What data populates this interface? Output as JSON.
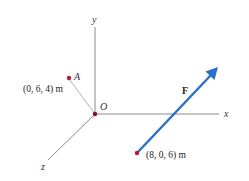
{
  "diagram": {
    "axes": {
      "x_label": "x",
      "y_label": "y",
      "z_label": "z",
      "origin_label": "O",
      "axis_color": "#8a8a8a"
    },
    "point_a": {
      "name": "A",
      "coords_label": "(0, 6, 4) m",
      "color": "#c0143c"
    },
    "force": {
      "name": "F",
      "tail_label": "(8, 0, 6) m",
      "color": "#2a6fc9",
      "tail_color": "#c0143c"
    }
  }
}
